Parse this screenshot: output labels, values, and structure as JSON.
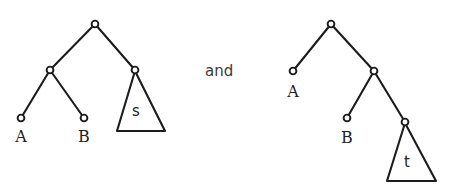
{
  "figure": {
    "type": "tree-diagram-pair",
    "background_color": "#ffffff",
    "stroke_color": "#1c1c1c",
    "conjunction": "and",
    "width": 453,
    "height": 188
  },
  "left_tree": {
    "name": "left-tree",
    "nodes": [
      {
        "id": "root",
        "label": "",
        "x": 95,
        "y": 24
      },
      {
        "id": "inner",
        "label": "",
        "x": 50,
        "y": 70
      },
      {
        "id": "leafA",
        "label": "A",
        "x": 21,
        "y": 118,
        "label_x": 21,
        "label_y": 142
      },
      {
        "id": "leafB",
        "label": "B",
        "x": 84,
        "y": 118,
        "label_x": 84,
        "label_y": 142
      },
      {
        "id": "subt",
        "label": "",
        "x": 135,
        "y": 70
      }
    ],
    "edges": [
      {
        "from": "root",
        "to": "inner"
      },
      {
        "from": "root",
        "to": "subt"
      },
      {
        "from": "inner",
        "to": "leafA"
      },
      {
        "from": "inner",
        "to": "leafB"
      }
    ],
    "triangle": {
      "label": "s",
      "apex_x": 135,
      "apex_y": 71,
      "left_x": 117,
      "right_x": 165,
      "base_y": 131,
      "label_x": 136,
      "label_y": 116
    }
  },
  "right_tree": {
    "name": "right-tree",
    "nodes": [
      {
        "id": "root",
        "label": "",
        "x": 331,
        "y": 24
      },
      {
        "id": "leafA",
        "label": "A",
        "x": 293,
        "y": 71,
        "label_x": 293,
        "label_y": 97
      },
      {
        "id": "inner",
        "label": "",
        "x": 374,
        "y": 71
      },
      {
        "id": "leafB",
        "label": "B",
        "x": 347,
        "y": 118,
        "label_x": 347,
        "label_y": 143
      },
      {
        "id": "subt",
        "label": "",
        "x": 405,
        "y": 122
      }
    ],
    "edges": [
      {
        "from": "root",
        "to": "leafA"
      },
      {
        "from": "root",
        "to": "inner"
      },
      {
        "from": "inner",
        "to": "leafB"
      },
      {
        "from": "inner",
        "to": "subt"
      }
    ],
    "triangle": {
      "label": "t",
      "apex_x": 405,
      "apex_y": 123,
      "left_x": 387,
      "right_x": 436,
      "base_y": 181,
      "label_x": 407,
      "label_y": 167
    }
  },
  "conjunction": {
    "text": "and",
    "x": 205,
    "y": 76
  }
}
